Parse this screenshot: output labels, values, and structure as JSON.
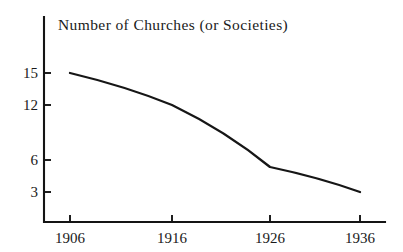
{
  "chart_data": {
    "type": "line",
    "title": "Number of Churches (or Societies)",
    "xlabel": "",
    "ylabel": "",
    "x": [
      1906,
      1916,
      1926,
      1936
    ],
    "categories": [
      "1906",
      "1916",
      "1926",
      "1936"
    ],
    "values": [
      15,
      12,
      5.4,
      3
    ],
    "series": [
      {
        "name": "Number of Churches (or Societies)",
        "values": [
          15,
          12,
          5.4,
          3
        ]
      }
    ],
    "x_tick_labels": [
      "1906",
      "1916",
      "1926",
      "1936"
    ],
    "y_tick_labels": [
      "15",
      "12",
      "6",
      "3"
    ],
    "y_tick_values": [
      15,
      12,
      6,
      3
    ],
    "xlim": [
      1906,
      1936
    ],
    "ylim": [
      0,
      16.5
    ],
    "grid": false,
    "legend": false,
    "legend_position": "none",
    "line_color": "#161616",
    "axis_color": "#141414",
    "background_color": "#ffffff",
    "annotations": []
  },
  "figure": {
    "title": "Number of Churches (or Societies)"
  },
  "geometry": {
    "axis_x": 44,
    "axis_top": 17,
    "axis_bottom": 222,
    "axis_right": 385,
    "x_positions": [
      70,
      172,
      270,
      360
    ],
    "y_positions_ticks": [
      73,
      105,
      160,
      192
    ],
    "point_positions": [
      {
        "x": 70,
        "y": 73
      },
      {
        "x": 172,
        "y": 105
      },
      {
        "x": 270,
        "y": 167
      },
      {
        "x": 360,
        "y": 192
      }
    ],
    "title_x": 58,
    "title_y": 30
  }
}
